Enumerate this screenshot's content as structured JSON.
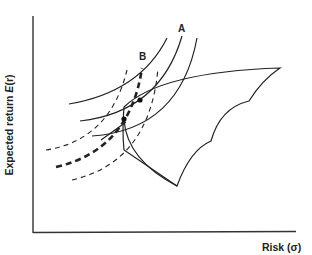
{
  "diagram": {
    "y_axis_label": "Expected return E(r)",
    "y_axis_label_prefix": "Expected return ",
    "y_axis_label_symbol": "E",
    "y_axis_label_paren": "(r)",
    "x_axis_label": "Risk (σ)",
    "curve_labels": {
      "a": "A",
      "b": "B"
    },
    "elements": [
      {
        "name": "indifference-curves-A",
        "style": "solid",
        "count": 3
      },
      {
        "name": "indifference-curves-B",
        "style": "dashed",
        "count": 3,
        "middle": "bold-dashed"
      },
      {
        "name": "opportunity-set",
        "style": "solid",
        "shape": "scalloped region"
      },
      {
        "name": "tangency-points",
        "count": 2
      }
    ],
    "colors": {
      "ink": "#222222",
      "background": "#ffffff"
    }
  }
}
